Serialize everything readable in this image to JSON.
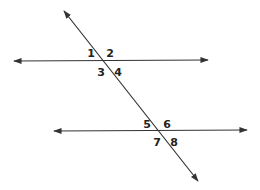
{
  "diagram": {
    "type": "parallel-lines-transversal",
    "stroke_color": "#333333",
    "background": "#ffffff",
    "lines": [
      {
        "name": "top-parallel-line",
        "x1": 14,
        "y1": 61,
        "x2": 208,
        "y2": 60,
        "arrows": "both"
      },
      {
        "name": "bottom-parallel-line",
        "x1": 54,
        "y1": 131,
        "x2": 247,
        "y2": 130,
        "arrows": "both"
      },
      {
        "name": "transversal",
        "x1": 64,
        "y1": 11,
        "x2": 198,
        "y2": 181,
        "arrows": "both"
      }
    ],
    "angle_labels": [
      {
        "text": "1",
        "x": 91,
        "y": 53
      },
      {
        "text": "2",
        "x": 110,
        "y": 53
      },
      {
        "text": "3",
        "x": 101,
        "y": 72
      },
      {
        "text": "4",
        "x": 118,
        "y": 72
      },
      {
        "text": "5",
        "x": 147,
        "y": 124
      },
      {
        "text": "6",
        "x": 167,
        "y": 124
      },
      {
        "text": "7",
        "x": 157,
        "y": 142
      },
      {
        "text": "8",
        "x": 174,
        "y": 142
      }
    ]
  }
}
